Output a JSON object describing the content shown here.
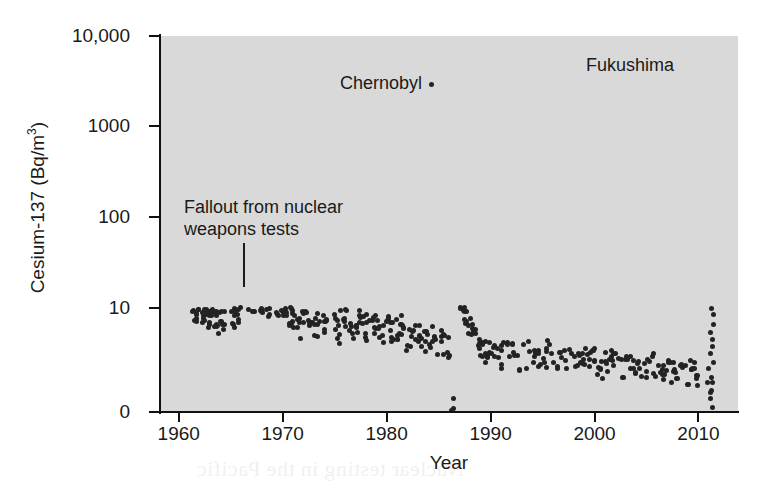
{
  "chart_data": {
    "type": "scatter",
    "title": "",
    "xlabel": "Year",
    "ylabel_text": "Cesium-137 (Bq/m",
    "ylabel_sup": "3",
    "ylabel_tail": ")",
    "ylabel_full": "Cesium-137 (Bq/m3)",
    "xlim": [
      1958.2,
      2013.8
    ],
    "ylim_log": [
      0.9,
      10000
    ],
    "yscale": "log",
    "grid": true,
    "legend": "none",
    "xticks": [
      "1960",
      "1970",
      "1980",
      "1990",
      "2000",
      "2010"
    ],
    "xtick_values": [
      1960,
      1970,
      1980,
      1990,
      2000,
      2010
    ],
    "yticks": [
      "10,000",
      "1000",
      "100",
      "10",
      "0"
    ],
    "ytick_values": [
      10000,
      1000,
      100,
      10,
      0
    ],
    "colors": {
      "plot_background": "#d9d9d9",
      "gridline": "#f2f2f2",
      "marker": "#232323",
      "axis": "#111111",
      "page_background": "#ffffff"
    },
    "annotations": [
      {
        "name": "fallout",
        "text": "Fallout from nuclear\nweapons tests",
        "x": 1965.6,
        "y_log": 240,
        "leader": true
      },
      {
        "name": "chernobyl",
        "text": "Chernobyl",
        "x": 1975.2,
        "y_log": 2600,
        "leader": false
      },
      {
        "name": "fukushima",
        "text": "Fukushima",
        "x": 2000.0,
        "y_log": 5200,
        "leader": false
      }
    ],
    "events": [
      {
        "name": "Chernobyl",
        "year": 1986.4,
        "peak": 2000,
        "low": 20
      },
      {
        "name": "Fukushima",
        "year": 2011.3,
        "peak": 3000,
        "low": 1.2
      }
    ],
    "series": [
      {
        "name": "Cesium-137 surface air concentration",
        "points": [
          [
            1960.7,
            32
          ],
          [
            1960.8,
            26
          ],
          [
            1960.9,
            19
          ],
          [
            1961.0,
            15
          ],
          [
            1961.1,
            13
          ],
          [
            1961.2,
            12
          ],
          [
            1961.3,
            11
          ],
          [
            1961.4,
            14
          ],
          [
            1961.5,
            17
          ],
          [
            1961.6,
            10
          ],
          [
            1961.7,
            9
          ],
          [
            1961.8,
            12
          ],
          [
            1961.9,
            16
          ],
          [
            1962.0,
            13
          ],
          [
            1962.1,
            11
          ],
          [
            1962.2,
            10
          ],
          [
            1962.3,
            9.5
          ],
          [
            1962.4,
            9
          ],
          [
            1962.5,
            12
          ],
          [
            1962.6,
            14
          ],
          [
            1962.7,
            10
          ],
          [
            1962.8,
            8.5
          ],
          [
            1962.9,
            8
          ],
          [
            1963.0,
            9
          ],
          [
            1963.1,
            11
          ],
          [
            1963.2,
            13
          ],
          [
            1963.3,
            10
          ],
          [
            1963.4,
            9
          ],
          [
            1963.5,
            8
          ],
          [
            1963.6,
            7.5
          ],
          [
            1963.7,
            7
          ],
          [
            1963.8,
            9
          ],
          [
            1963.9,
            11
          ],
          [
            1964.0,
            10
          ],
          [
            1964.2,
            9
          ],
          [
            1964.4,
            8
          ],
          [
            1964.6,
            12
          ],
          [
            1964.8,
            14
          ],
          [
            1965.0,
            11
          ],
          [
            1965.2,
            9
          ],
          [
            1965.4,
            8
          ],
          [
            1965.6,
            7
          ],
          [
            1965.8,
            13
          ],
          [
            1966.0,
            16
          ],
          [
            1966.2,
            18
          ],
          [
            1966.4,
            14
          ],
          [
            1966.5,
            12
          ],
          [
            1966.6,
            11
          ],
          [
            1966.7,
            15
          ],
          [
            1966.8,
            20
          ],
          [
            1966.9,
            17
          ],
          [
            1967.0,
            14
          ],
          [
            1967.1,
            12
          ],
          [
            1967.2,
            11
          ],
          [
            1967.3,
            10
          ],
          [
            1967.4,
            13
          ],
          [
            1967.5,
            16
          ],
          [
            1967.6,
            19
          ],
          [
            1967.7,
            15
          ],
          [
            1967.8,
            12
          ],
          [
            1967.9,
            11
          ],
          [
            1968.0,
            10
          ],
          [
            1968.1,
            14
          ],
          [
            1968.2,
            17
          ],
          [
            1968.3,
            21
          ],
          [
            1968.4,
            18
          ],
          [
            1968.5,
            15
          ],
          [
            1968.6,
            13
          ],
          [
            1968.7,
            11
          ],
          [
            1968.8,
            10
          ],
          [
            1968.9,
            12
          ],
          [
            1969.0,
            15
          ],
          [
            1969.1,
            18
          ],
          [
            1969.2,
            14
          ],
          [
            1969.3,
            12
          ],
          [
            1969.4,
            10
          ],
          [
            1969.5,
            9
          ],
          [
            1969.6,
            11
          ],
          [
            1969.7,
            13
          ],
          [
            1969.8,
            16
          ],
          [
            1969.9,
            12
          ],
          [
            1970.0,
            10
          ],
          [
            1970.1,
            9
          ],
          [
            1970.2,
            8
          ],
          [
            1970.3,
            10
          ],
          [
            1970.4,
            13
          ],
          [
            1970.5,
            15
          ],
          [
            1970.6,
            11
          ],
          [
            1970.7,
            9
          ],
          [
            1970.8,
            8
          ],
          [
            1970.9,
            7
          ],
          [
            1971.0,
            9
          ],
          [
            1971.2,
            11
          ],
          [
            1971.4,
            8
          ],
          [
            1971.6,
            6.5
          ],
          [
            1971.8,
            5.5
          ],
          [
            1972.0,
            7
          ],
          [
            1972.3,
            9
          ],
          [
            1972.6,
            6
          ],
          [
            1972.9,
            5
          ],
          [
            1973.2,
            6.5
          ],
          [
            1973.5,
            8
          ],
          [
            1973.8,
            6
          ],
          [
            1974.0,
            7
          ],
          [
            1974.3,
            9
          ],
          [
            1974.6,
            10
          ],
          [
            1974.9,
            7
          ],
          [
            1975.2,
            6
          ],
          [
            1975.5,
            5.5
          ],
          [
            1975.8,
            7
          ],
          [
            1976.1,
            8
          ],
          [
            1976.4,
            6.5
          ],
          [
            1976.7,
            5.5
          ],
          [
            1977.0,
            6
          ],
          [
            1977.3,
            7.5
          ],
          [
            1977.6,
            9
          ],
          [
            1977.9,
            6.5
          ],
          [
            1978.2,
            5.5
          ],
          [
            1978.5,
            6
          ],
          [
            1978.8,
            7
          ],
          [
            1979.1,
            6
          ],
          [
            1979.4,
            5
          ],
          [
            1979.7,
            5.5
          ],
          [
            1980.0,
            6
          ],
          [
            1980.3,
            7
          ],
          [
            1980.6,
            5.5
          ],
          [
            1980.9,
            5
          ],
          [
            1981.2,
            5.5
          ],
          [
            1981.5,
            6.5
          ],
          [
            1981.8,
            5
          ],
          [
            1982.1,
            4.5
          ],
          [
            1982.4,
            5
          ],
          [
            1982.7,
            6
          ],
          [
            1983.0,
            5
          ],
          [
            1983.3,
            4.5
          ],
          [
            1983.6,
            4
          ],
          [
            1983.9,
            4.5
          ],
          [
            1984.2,
            5
          ],
          [
            1984.5,
            4
          ],
          [
            1984.8,
            3.8
          ],
          [
            1985.1,
            4
          ],
          [
            1985.4,
            4.5
          ],
          [
            1985.7,
            4
          ],
          [
            1986.0,
            3.8
          ],
          [
            1986.9,
            9
          ],
          [
            1987.2,
            11
          ],
          [
            1987.5,
            8
          ],
          [
            1987.8,
            7
          ],
          [
            1988.1,
            6
          ],
          [
            1988.4,
            5
          ],
          [
            1988.7,
            4.5
          ],
          [
            1989.0,
            4
          ],
          [
            1989.3,
            3.5
          ],
          [
            1989.6,
            3.2
          ],
          [
            1990.0,
            3.5
          ],
          [
            1990.4,
            4
          ],
          [
            1990.8,
            3.2
          ],
          [
            1991.2,
            3
          ],
          [
            1991.6,
            3.5
          ],
          [
            1992.0,
            4
          ],
          [
            1992.4,
            3.2
          ],
          [
            1992.8,
            2.8
          ],
          [
            1993.2,
            3
          ],
          [
            1993.6,
            3.5
          ],
          [
            1994.0,
            3
          ],
          [
            1994.4,
            2.8
          ],
          [
            1994.8,
            2.6
          ],
          [
            1995.2,
            3
          ],
          [
            1995.6,
            3.4
          ],
          [
            1996.0,
            3
          ],
          [
            1996.4,
            2.7
          ],
          [
            1996.8,
            2.5
          ],
          [
            1997.2,
            2.8
          ],
          [
            1997.6,
            3.2
          ],
          [
            1998.0,
            3
          ],
          [
            1998.4,
            2.6
          ],
          [
            1998.8,
            2.4
          ],
          [
            1999.2,
            2.8
          ],
          [
            1999.6,
            3
          ],
          [
            2000.0,
            2.6
          ],
          [
            2000.4,
            2.4
          ],
          [
            2000.8,
            2.2
          ],
          [
            2001.2,
            2.5
          ],
          [
            2001.6,
            2.8
          ],
          [
            2002.0,
            2.4
          ],
          [
            2002.4,
            2.2
          ],
          [
            2002.8,
            2.0
          ],
          [
            2003.2,
            2.3
          ],
          [
            2003.6,
            2.6
          ],
          [
            2004.0,
            2.2
          ],
          [
            2004.4,
            2.0
          ],
          [
            2004.8,
            1.9
          ],
          [
            2005.2,
            2.1
          ],
          [
            2005.6,
            2.4
          ],
          [
            2006.0,
            2.0
          ],
          [
            2006.4,
            1.9
          ],
          [
            2006.8,
            1.8
          ],
          [
            2007.2,
            2.0
          ],
          [
            2007.6,
            2.2
          ],
          [
            2008.0,
            1.9
          ],
          [
            2008.4,
            1.8
          ],
          [
            2008.8,
            1.7
          ],
          [
            2009.2,
            1.9
          ],
          [
            2009.6,
            2.1
          ],
          [
            2010.0,
            1.8
          ]
        ]
      }
    ]
  },
  "bleed_text": [
    "the nuclear age",
    "a nuclear weapons test series was",
    "worldwide measurements of fallout",
    "from the Chernobyl accident",
    "atmospheric",
    "detectable",
    "Ministry concentrations were",
    "in the air monitoring",
    "Nuclear testing in the Pacific"
  ]
}
